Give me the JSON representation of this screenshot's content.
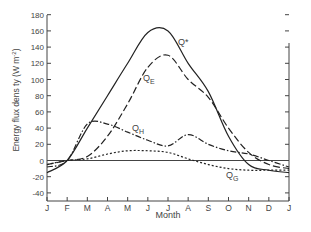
{
  "chart_data": {
    "type": "line",
    "title": "",
    "xlabel": "Month",
    "ylabel": "Energy flux density (W m-2)",
    "ylim": [
      -50,
      180
    ],
    "yticks": [
      180,
      160,
      140,
      120,
      100,
      80,
      60,
      40,
      20,
      0,
      -20,
      -40
    ],
    "categories": [
      "J",
      "F",
      "M",
      "A",
      "M",
      "J",
      "J",
      "A",
      "S",
      "O",
      "N",
      "D",
      "J"
    ],
    "grid": false,
    "legend": "inline labels",
    "series": [
      {
        "name": "Q*",
        "style": "solid",
        "values": [
          -15,
          0,
          40,
          80,
          120,
          158,
          160,
          120,
          85,
          30,
          -5,
          -12,
          -15
        ]
      },
      {
        "name": "QE",
        "style": "dashed",
        "values": [
          -5,
          0,
          5,
          30,
          70,
          115,
          130,
          100,
          78,
          40,
          10,
          -5,
          -10
        ]
      },
      {
        "name": "QH",
        "style": "dash-dot",
        "values": [
          -8,
          0,
          45,
          45,
          35,
          25,
          18,
          32,
          20,
          12,
          8,
          0,
          -8
        ]
      },
      {
        "name": "QG",
        "style": "dotted",
        "values": [
          -5,
          0,
          2,
          8,
          12,
          12,
          10,
          2,
          -5,
          -10,
          -12,
          -12,
          -12
        ]
      }
    ]
  },
  "labels": {
    "ylabel_main": "Energy  flux dens ty (W m",
    "ylabel_sup": "-2",
    "ylabel_close": ")",
    "qstar": "Q*",
    "qe_main": "Q",
    "qe_sub": "E",
    "qh_main": "Q",
    "qh_sub": "H",
    "qg_main": "Q",
    "qg_sub": "G"
  }
}
